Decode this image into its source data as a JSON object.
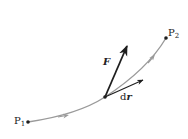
{
  "diagram": {
    "colors": {
      "path": "#9a9a9a",
      "vector": "#1e1e1e",
      "point": "#1e1e1e",
      "text": "#222222"
    },
    "points": {
      "p1": {
        "label": "P",
        "sub": "1",
        "x": 28,
        "y": 122
      },
      "p2": {
        "label": "P",
        "sub": "2",
        "x": 166,
        "y": 38
      },
      "origin": {
        "x": 105,
        "y": 97
      }
    },
    "vectors": {
      "force": {
        "label": "F",
        "tip_x": 127,
        "tip_y": 46
      },
      "displacement": {
        "label_d": "d",
        "label_r": "r",
        "tip_x": 143,
        "tip_y": 80
      }
    }
  }
}
